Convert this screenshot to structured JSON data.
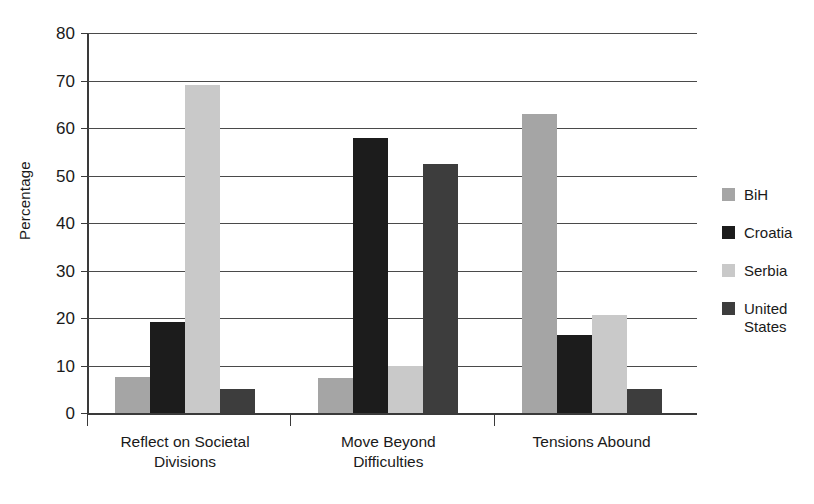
{
  "chart_data": {
    "type": "bar",
    "title": "",
    "subtitle": "",
    "xlabel": "",
    "ylabel": "Percentage",
    "ylim": [
      0,
      80
    ],
    "ytick_step": 10,
    "yticks": [
      80,
      70,
      60,
      50,
      40,
      30,
      20,
      10,
      0
    ],
    "grid": true,
    "legend_position": "right",
    "categories": [
      "Reflect on Societal Divisions",
      "Move Beyond Difficulties",
      "Tensions Abound"
    ],
    "category_lines": [
      [
        "Reflect on Societal",
        "Divisions"
      ],
      [
        "Move Beyond",
        "Difficulties"
      ],
      [
        "Tensions Abound",
        ""
      ]
    ],
    "series": [
      {
        "name": "BiH",
        "color": "#a5a5a5",
        "values": [
          7.5,
          7.3,
          63.0
        ]
      },
      {
        "name": "Croatia",
        "color": "#1c1c1c",
        "values": [
          19.2,
          58.0,
          16.5
        ]
      },
      {
        "name": "Serbia",
        "color": "#c9c9c9",
        "values": [
          69.0,
          10.0,
          20.7
        ]
      },
      {
        "name": "United States",
        "color": "#3d3d3d",
        "values": [
          5.1,
          52.5,
          5.1
        ]
      }
    ],
    "legend_entries": [
      {
        "label": "BiH",
        "label_lines": [
          "BiH",
          ""
        ],
        "color": "#a5a5a5"
      },
      {
        "label": "Croatia",
        "label_lines": [
          "Croatia",
          ""
        ],
        "color": "#1c1c1c"
      },
      {
        "label": "Serbia",
        "label_lines": [
          "Serbia",
          ""
        ],
        "color": "#c9c9c9"
      },
      {
        "label": "United States",
        "label_lines": [
          "United",
          "States"
        ],
        "color": "#3d3d3d"
      }
    ]
  }
}
